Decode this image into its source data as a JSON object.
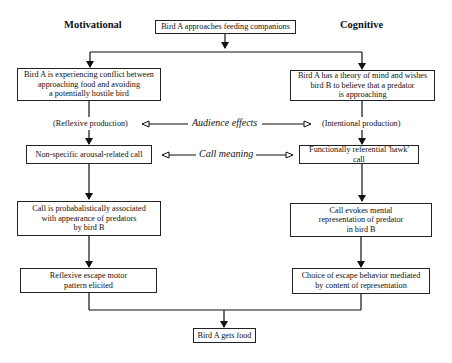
{
  "headings": {
    "left": "Motivational",
    "right": "Cognitive"
  },
  "start": "Bird A approaches feeding companions",
  "motivational": {
    "state": "Bird A is experiencing conflict between\napproaching food and avoiding\na potentially hostile bird",
    "production": "(Reflexive production)",
    "call": "Non-specific arousal-related call",
    "receiver": "Call is probabalistically associated\nwith appearance of predators\nby bird B",
    "response": "Reflexive escape motor\npattern elicited"
  },
  "cognitive": {
    "state": "Bird A has a theory of mind and wishes\nbird B to believe that a predator\nis approaching",
    "production": "(Intentional production)",
    "call": "Functionally referential 'hawk' call",
    "receiver": "Call evokes mental\nrepresentation of predator\nin bird B",
    "response": "Choice of escape behavior mediated\nby content of representation"
  },
  "links": {
    "audience_effects": "Audience effects",
    "call_meaning": "Call meaning"
  },
  "end": "Bird A gets food"
}
